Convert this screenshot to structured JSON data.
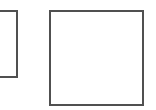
{
  "canvas": {
    "width": 156,
    "height": 110,
    "background": "#ffffff"
  },
  "shapes": [
    {
      "id": "box-left",
      "type": "rectangle",
      "border_color": "#505050",
      "fill": "#ffffff",
      "partially_clipped": true
    },
    {
      "id": "box-right",
      "type": "rectangle",
      "border_color": "#505050",
      "fill": "#ffffff"
    }
  ]
}
